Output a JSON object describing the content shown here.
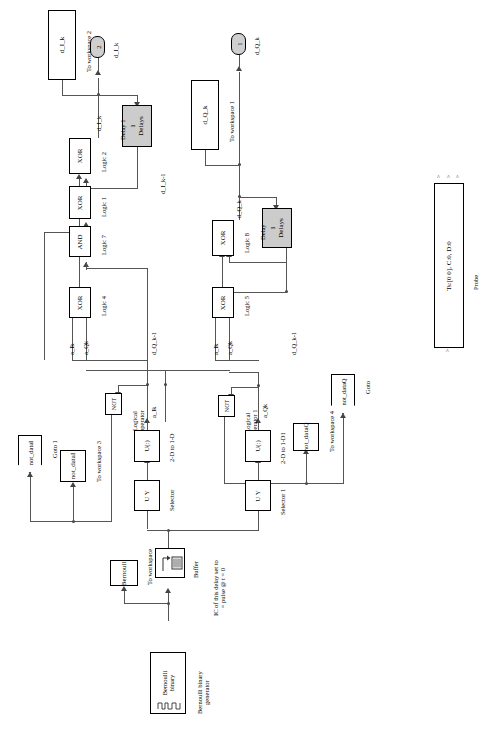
{
  "diagram": {
    "accent": "#cccccc"
  },
  "blocks": {
    "to_workspace_2": {
      "text": "d_I_k",
      "caption": "To workspace 2"
    },
    "to_workspace_1": {
      "text": "d_Q_k",
      "caption": "To workspace 1"
    },
    "to_workspace_3": {
      "text": "not_dataI",
      "caption": "To workspace 3"
    },
    "to_workspace_4": {
      "text": "not_dataQ",
      "caption": "To workspace 4"
    },
    "to_workspace_0": {
      "text": "Bernoulli",
      "caption": "To workspace"
    },
    "delay_1": {
      "text": "1\nDelays",
      "caption": "Delay 1"
    },
    "delay_2": {
      "text": "1\nDelays",
      "caption": "Delay"
    },
    "logic_2": {
      "text": "XOR",
      "caption": "Logic 2"
    },
    "logic_1": {
      "text": "XOR",
      "caption": "Logic 1"
    },
    "logic_7": {
      "text": "AND",
      "caption": "Logic 7"
    },
    "logic_4": {
      "text": "XOR",
      "caption": "Logic 4"
    },
    "logic_8": {
      "text": "XOR",
      "caption": "Logic 8"
    },
    "logic_5": {
      "text": "XOR",
      "caption": "Logic 5"
    },
    "not_1": {
      "text": "NOT",
      "caption": "Logical\noperator"
    },
    "not_2": {
      "text": "NOT",
      "caption": "Logical\noperator 1"
    },
    "reshape_1": {
      "text": "U(:)",
      "caption": "2-D to 1-D"
    },
    "reshape_2": {
      "text": "U(:)",
      "caption": "2-D to 1-D1"
    },
    "selector_1": {
      "text": "U  Y",
      "caption": "Selector"
    },
    "selector_2": {
      "text": "U  Y",
      "caption": "Selector 1"
    },
    "buffer": {
      "text": "",
      "caption": "Buffer"
    },
    "bernoulli": {
      "text": "Bernoulli\nbinary",
      "caption": "Bernoulli binary\ngenerator"
    },
    "probe": {
      "text": "Ts:[0 0], C:0, D:0",
      "caption": "Probe"
    }
  },
  "ports": {
    "outport_2": {
      "number": "2",
      "label": "d_I_k"
    },
    "outport_1": {
      "number": "1",
      "label": "d_Q_k"
    }
  },
  "gotos": {
    "goto_1": {
      "text": "not_dataI",
      "caption": "Goto 1"
    },
    "goto_2": {
      "text": "not_dataQ",
      "caption": "Goto"
    }
  },
  "signals": {
    "d_I_k": "d_I_k",
    "d_I_k_m1": "d_I_k-1",
    "d_Q_k": "d_Q_k",
    "d_Q_k_m1a": "d_Q_k-1",
    "d_Q_k_m1b": "d_Q_k-1",
    "a_Ik_1": "a_Ik",
    "a_Qk_1": "a_Qk",
    "a_Ik_2": "a_Ik",
    "a_Qk_2": "a_Qk",
    "a_Ik_3": "a_Ik",
    "a_Qk_3": "a_Qk"
  },
  "notes": {
    "ic_note": "IC of this delay set to\n= pulse @ t = 0"
  }
}
